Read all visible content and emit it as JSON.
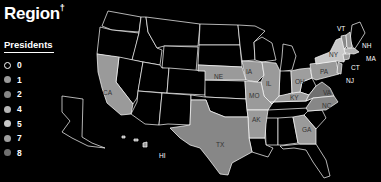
{
  "title": "Region",
  "title_mark": "†",
  "legend": {
    "heading": "Presidents",
    "items": [
      {
        "label": "0",
        "color": "#000000"
      },
      {
        "label": "1",
        "color": "#9a9a9a"
      },
      {
        "label": "2",
        "color": "#878787"
      },
      {
        "label": "4",
        "color": "#b5b5b5"
      },
      {
        "label": "5",
        "color": "#c8c8c8"
      },
      {
        "label": "7",
        "color": "#9e9e9e"
      },
      {
        "label": "8",
        "color": "#6f6f6f"
      }
    ]
  },
  "states": {
    "CA": {
      "label": "CA",
      "presidents": 1
    },
    "NE": {
      "label": "NE",
      "presidents": 1
    },
    "IA": {
      "label": "IA",
      "presidents": 1
    },
    "IL": {
      "label": "IL",
      "presidents": 1
    },
    "MO": {
      "label": "MO",
      "presidents": 1
    },
    "AK": {
      "label": "AK",
      "presidents": 1
    },
    "TX": {
      "label": "TX",
      "presidents": 2
    },
    "HI": {
      "label": "HI",
      "presidents": 1
    },
    "OH": {
      "label": "OH",
      "presidents": 7
    },
    "KY": {
      "label": "KY",
      "presidents": 1
    },
    "PA": {
      "label": "PA",
      "presidents": 1
    },
    "NY": {
      "label": "NY",
      "presidents": 5
    },
    "VT": {
      "label": "VT",
      "presidents": 2
    },
    "NH": {
      "label": "NH",
      "presidents": 1
    },
    "MA": {
      "label": "MA",
      "presidents": 4
    },
    "CT": {
      "label": "CT",
      "presidents": 1
    },
    "NJ": {
      "label": "NJ",
      "presidents": 1
    },
    "VA": {
      "label": "VA",
      "presidents": 8
    },
    "NC": {
      "label": "NC",
      "presidents": 2
    },
    "GA": {
      "label": "GA",
      "presidents": 1
    }
  }
}
